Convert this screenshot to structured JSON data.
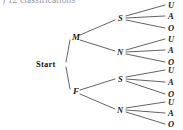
{
  "caption": {
    "text": ") 12 classifications",
    "clipped": true
  },
  "colors": {
    "background": "#ffffff",
    "line": "#3c3c3c",
    "text": "#1b1b1b",
    "caption_text": "#9a9a9a"
  },
  "diagram": {
    "type": "tree",
    "root": {
      "label": "Start",
      "x": 48,
      "y": 64
    },
    "level1": [
      {
        "label": "M",
        "x": 74,
        "y": 37
      },
      {
        "label": "F",
        "x": 74,
        "y": 92
      }
    ],
    "level2": [
      {
        "label": "S",
        "x": 120,
        "y": 18,
        "parent": "M"
      },
      {
        "label": "N",
        "x": 120,
        "y": 52,
        "parent": "M"
      },
      {
        "label": "S",
        "x": 120,
        "y": 79,
        "parent": "F"
      },
      {
        "label": "N",
        "x": 120,
        "y": 110,
        "parent": "F"
      }
    ],
    "leaves": [
      {
        "label": "U",
        "x": 170,
        "y": 7,
        "parent_index": 0
      },
      {
        "label": "A",
        "x": 170,
        "y": 18,
        "parent_index": 0
      },
      {
        "label": "O",
        "x": 170,
        "y": 30,
        "parent_index": 0
      },
      {
        "label": "U",
        "x": 170,
        "y": 41,
        "parent_index": 1
      },
      {
        "label": "A",
        "x": 170,
        "y": 52,
        "parent_index": 1
      },
      {
        "label": "O",
        "x": 170,
        "y": 64,
        "parent_index": 1
      },
      {
        "label": "U",
        "x": 170,
        "y": 72,
        "parent_index": 2
      },
      {
        "label": "A",
        "x": 170,
        "y": 84,
        "parent_index": 2
      },
      {
        "label": "O",
        "x": 170,
        "y": 96,
        "parent_index": 2
      },
      {
        "label": "U",
        "x": 170,
        "y": 104,
        "parent_index": 3
      },
      {
        "label": "A",
        "x": 170,
        "y": 115,
        "parent_index": 3
      },
      {
        "label": "O",
        "x": 170,
        "y": 126,
        "parent_index": 3
      }
    ],
    "leaf_count": 12
  }
}
